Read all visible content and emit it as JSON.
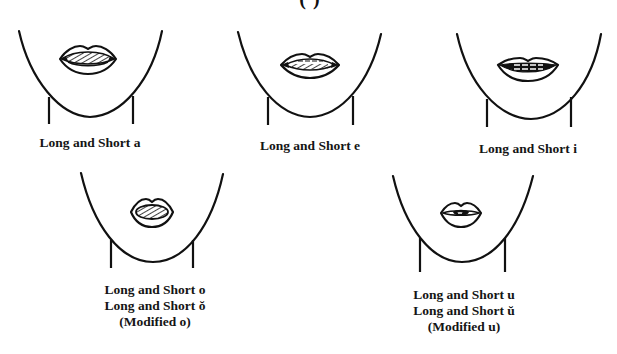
{
  "header": {
    "cut_off_title": "(                                   )"
  },
  "diagram": {
    "stroke_color": "#111111",
    "background": "#ffffff",
    "faces": [
      {
        "id": "a",
        "label_lines": [
          "Long and Short a"
        ],
        "mouth_shape": "wide-open-teeth-hatched"
      },
      {
        "id": "e",
        "label_lines": [
          "Long and Short e"
        ],
        "mouth_shape": "wide-narrow-teeth-hatched"
      },
      {
        "id": "i",
        "label_lines": [
          "Long and Short i"
        ],
        "mouth_shape": "smile-teeth-together"
      },
      {
        "id": "o",
        "label_lines": [
          "Long and Short o",
          "Long and Short ŏ",
          "(Modified o)"
        ],
        "mouth_shape": "rounded-oval-hatched"
      },
      {
        "id": "u",
        "label_lines": [
          "Long and Short u",
          "Long and Short ŭ",
          "(Modified u)"
        ],
        "mouth_shape": "small-rounded-pucker"
      }
    ]
  }
}
